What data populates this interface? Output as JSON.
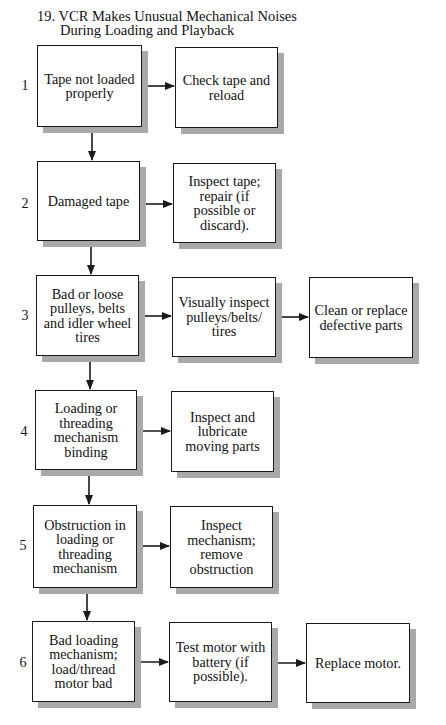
{
  "title": {
    "line1": "19. VCR Makes Unusual Mechanical Noises",
    "line2": "During Loading and Playback"
  },
  "colors": {
    "line": "#1a1a1a",
    "shadow": "#a9a9a9",
    "background": "#ffffff"
  },
  "steps": [
    {
      "number": "1",
      "cause": "Tape not loaded properly",
      "actions": [
        "Check tape and reload"
      ]
    },
    {
      "number": "2",
      "cause": "Damaged tape",
      "actions": [
        "Inspect tape; repair (if possible or discard)."
      ]
    },
    {
      "number": "3",
      "cause": "Bad or loose pulleys, belts and idler wheel tires",
      "actions": [
        "Visually inspect pulleys/belts/ tires",
        "Clean or replace defective parts"
      ]
    },
    {
      "number": "4",
      "cause": "Loading or threading mechanism binding",
      "actions": [
        "Inspect and lubricate moving parts"
      ]
    },
    {
      "number": "5",
      "cause": "Obstruction in loading or threading mechanism",
      "actions": [
        "Inspect mechanism; remove obstruction"
      ]
    },
    {
      "number": "6",
      "cause": "Bad loading mechanism; load/thread motor bad",
      "actions": [
        "Test motor with battery (if possible).",
        "Replace motor."
      ]
    }
  ]
}
